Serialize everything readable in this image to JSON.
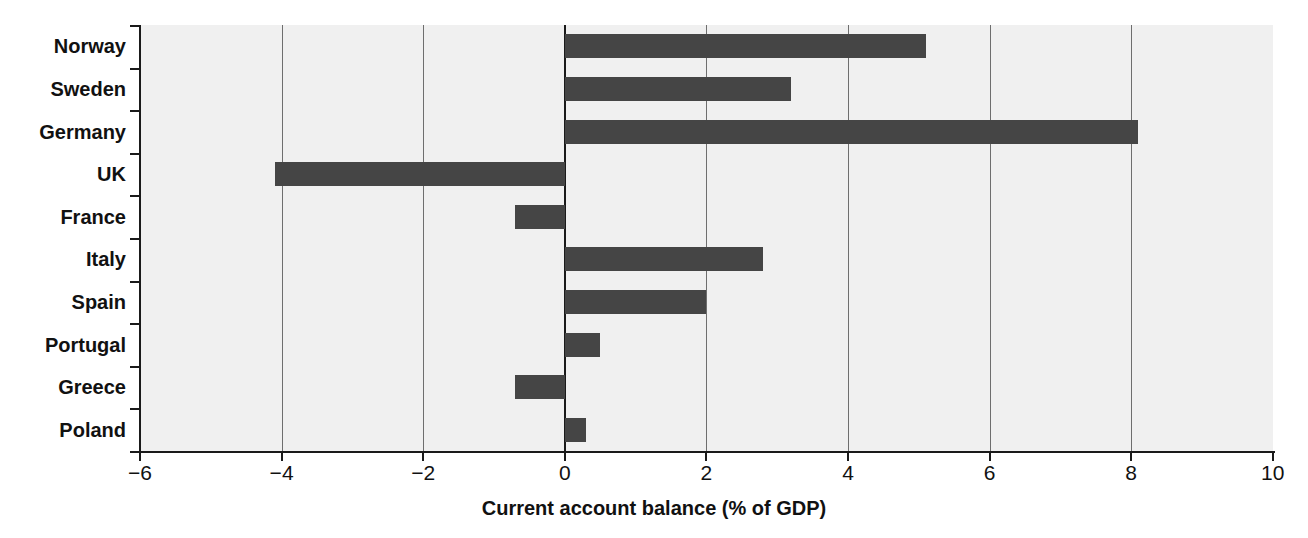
{
  "chart_data": {
    "type": "bar",
    "orientation": "horizontal",
    "title": "",
    "xlabel": "Current account balance (% of GDP)",
    "ylabel": "",
    "categories": [
      "Norway",
      "Sweden",
      "Germany",
      "UK",
      "France",
      "Italy",
      "Spain",
      "Portugal",
      "Greece",
      "Poland"
    ],
    "values": [
      5.1,
      3.2,
      8.1,
      -4.1,
      -0.7,
      2.8,
      2.0,
      0.5,
      -0.7,
      0.3
    ],
    "xlim": [
      -6,
      10
    ],
    "xticks": [
      -6,
      -4,
      -2,
      0,
      2,
      4,
      6,
      8,
      10
    ],
    "xtick_labels": [
      "−6",
      "−4",
      "−2",
      "0",
      "2",
      "4",
      "6",
      "8",
      "10"
    ],
    "grid": true,
    "grid_axis": "x",
    "legend": false,
    "bar_color": "#454545",
    "plot_background": "#f0f0f0",
    "axis_color": "#1a1a1a",
    "gridline_color": "#6e6e6e"
  },
  "axis": {
    "x_title": "Current account balance (% of GDP)"
  }
}
